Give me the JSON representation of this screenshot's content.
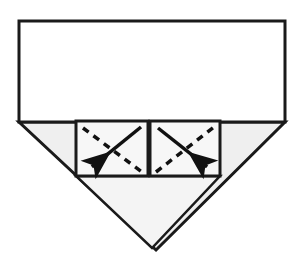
{
  "figure": {
    "background_color": "#ffffff",
    "canvas": {
      "width": 301,
      "height": 268
    }
  },
  "colors": {
    "paper_white": "#ffffff",
    "paper_gray": "#efefef",
    "paper_gray_light": "#f4f4f4",
    "outline": "#1a1a1a",
    "arrow": "#111111",
    "crease_dashed": "#111111"
  },
  "shapes": {
    "top_rectangle": {
      "name": "top-rectangle",
      "fill": "#ffffff",
      "stroke": "#1a1a1a",
      "stroke_width": 3,
      "points": "19,21 285,21 285,122 19,122"
    },
    "bottom_triangle": {
      "name": "bottom-triangle-flap",
      "fill": "#efefef",
      "stroke": "#1a1a1a",
      "stroke_width": 3,
      "points": "19,122 285,122 156,250"
    },
    "inner_triangle": {
      "name": "inner-folded-triangle",
      "fill": "#f4f4f4",
      "stroke": "#1a1a1a",
      "stroke_width": 2.5,
      "points": "76,176 220,176 152,248"
    },
    "left_square": {
      "name": "left-fold-square",
      "fill": "#f7f7f7",
      "stroke": "#1a1a1a",
      "stroke_width": 3,
      "x": 76,
      "y": 121,
      "width": 72,
      "height": 55
    },
    "right_square": {
      "name": "right-fold-square",
      "fill": "#f7f7f7",
      "stroke": "#1a1a1a",
      "stroke_width": 3,
      "x": 150,
      "y": 121,
      "width": 70,
      "height": 55
    }
  },
  "annotations": {
    "left_square_dashed_crease": {
      "name": "left-square-dashed-crease",
      "type": "dashed-line",
      "direction": "top-left-to-bottom-right",
      "from": [
        83,
        128
      ],
      "to": [
        142,
        172
      ],
      "dash_pattern": "7 6",
      "stroke_width": 3.5
    },
    "left_square_solid_arrow": {
      "name": "left-square-fold-arrow",
      "type": "solid-arrow",
      "direction": "down-left",
      "from": [
        141,
        127
      ],
      "to": [
        88,
        170
      ],
      "stroke_width": 3.5
    },
    "right_square_dashed_crease": {
      "name": "right-square-dashed-crease",
      "type": "dashed-line",
      "direction": "bottom-left-to-top-right",
      "from": [
        156,
        172
      ],
      "to": [
        214,
        127
      ],
      "dash_pattern": "7 6",
      "stroke_width": 3.5
    },
    "right_square_solid_arrow": {
      "name": "right-square-fold-arrow",
      "type": "solid-arrow",
      "direction": "down-right",
      "from": [
        158,
        128
      ],
      "to": [
        211,
        170
      ],
      "stroke_width": 3.5
    }
  },
  "labels": {
    "figure_alt": "Origami diagram: fold the two marked square flaps inward along the dashed diagonals"
  }
}
